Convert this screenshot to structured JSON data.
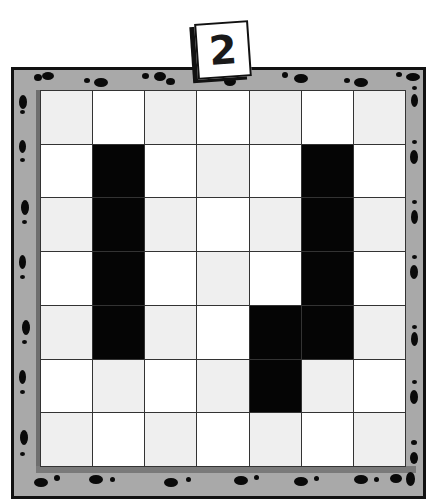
{
  "puzzle": {
    "level_label": "2",
    "rows": 7,
    "cols": 7,
    "cells": [
      [
        0,
        0,
        0,
        0,
        0,
        0,
        0
      ],
      [
        0,
        1,
        0,
        0,
        0,
        1,
        0
      ],
      [
        0,
        1,
        0,
        0,
        0,
        1,
        0
      ],
      [
        0,
        1,
        0,
        0,
        0,
        1,
        0
      ],
      [
        0,
        1,
        0,
        0,
        1,
        1,
        0
      ],
      [
        0,
        0,
        0,
        0,
        1,
        0,
        0
      ],
      [
        0,
        0,
        0,
        0,
        0,
        0,
        0
      ]
    ],
    "legend": {
      "0": "empty",
      "1": "filled"
    }
  },
  "colors": {
    "frame": "#a9a9a9",
    "frame_border": "#111111",
    "cell_white": "#ffffff",
    "cell_light": "#efefef",
    "cell_filled": "#050505",
    "grid_line": "#333333"
  },
  "decor": {
    "border_icon": "footprint-icon"
  }
}
